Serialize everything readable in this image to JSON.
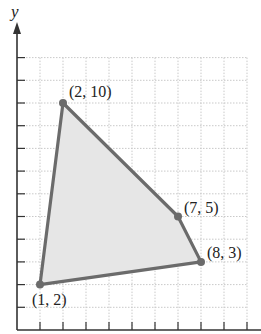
{
  "figure": {
    "axis_label_y": "y",
    "grid_color": "#c9c9c9",
    "axis_color": "#333333",
    "polygon_stroke": "#6b6b6b",
    "polygon_fill": "#e6e6e6",
    "vertex_color": "#6b6b6b"
  },
  "chart_data": {
    "type": "polygon",
    "title": "",
    "xlabel": "",
    "ylabel": "y",
    "xlim": [
      0,
      10
    ],
    "ylim": [
      0,
      12
    ],
    "grid": true,
    "vertices": [
      {
        "x": 2,
        "y": 10,
        "label": "(2, 10)"
      },
      {
        "x": 7,
        "y": 5,
        "label": "(7, 5)"
      },
      {
        "x": 8,
        "y": 3,
        "label": "(8, 3)"
      },
      {
        "x": 1,
        "y": 2,
        "label": "(1, 2)"
      }
    ]
  }
}
